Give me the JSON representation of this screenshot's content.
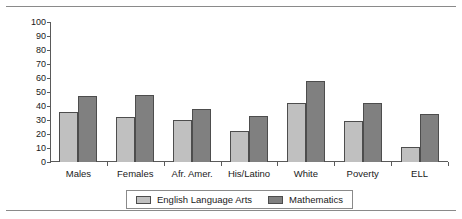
{
  "chart_data": {
    "type": "bar",
    "title": "",
    "xlabel": "",
    "ylabel": "",
    "ylim": [
      0,
      100
    ],
    "ytick_step": 10,
    "yticks": [
      0,
      10,
      20,
      30,
      40,
      50,
      60,
      70,
      80,
      90,
      100
    ],
    "grid": false,
    "legend_position": "bottom",
    "categories": [
      "Males",
      "Females",
      "Afr. Amer.",
      "His/Latino",
      "White",
      "Poverty",
      "ELL"
    ],
    "series": [
      {
        "name": "English Language Arts",
        "color": "#c0c0c0",
        "values": [
          36,
          32,
          30,
          22,
          42,
          29,
          11
        ]
      },
      {
        "name": "Mathematics",
        "color": "#808080",
        "values": [
          47,
          48,
          38,
          33,
          58,
          42,
          34
        ]
      }
    ]
  },
  "legend": {
    "items": [
      {
        "label": "English Language Arts",
        "swatch": "ela-swatch"
      },
      {
        "label": "Mathematics",
        "swatch": "math-swatch"
      }
    ]
  }
}
